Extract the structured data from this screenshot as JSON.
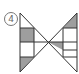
{
  "figure": {
    "label": "4",
    "shape": "bowtie",
    "colors": {
      "stroke": "#333333",
      "fill": "#9e9e9e",
      "background": "#ffffff"
    }
  }
}
